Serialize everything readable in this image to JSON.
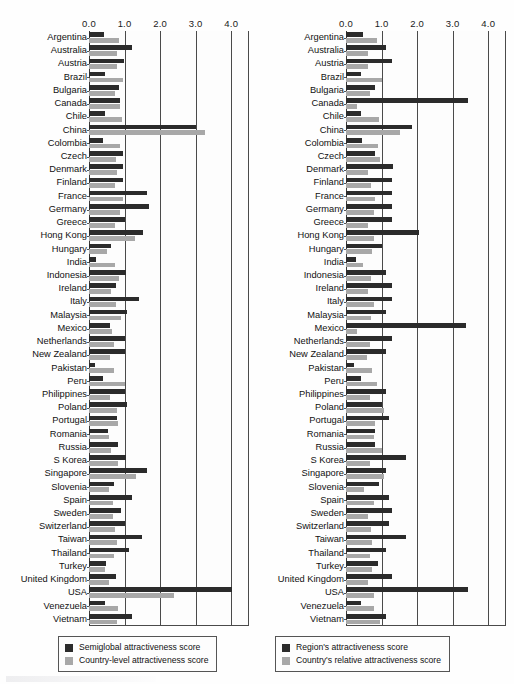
{
  "figure": {
    "type_note": "Two paired horizontal bar charts of country attractiveness scores",
    "axis_ticks": [
      "0.0",
      "1.0",
      "2.0",
      "3.0",
      "4.0"
    ],
    "axis_tick_values": [
      0.0,
      1.0,
      2.0,
      3.0,
      4.0
    ],
    "xlim": [
      0.0,
      4.5
    ],
    "grid": true
  },
  "countries": [
    "Argentina",
    "Australia",
    "Austria",
    "Brazil",
    "Bulgaria",
    "Canada",
    "Chile",
    "China",
    "Colombia",
    "Czech",
    "Denmark",
    "Finland",
    "France",
    "Germany",
    "Greece",
    "Hong Kong",
    "Hungary",
    "India",
    "Indonesia",
    "Ireland",
    "Italy",
    "Malaysia",
    "Mexico",
    "Netherlands",
    "New Zealand",
    "Pakistan",
    "Peru",
    "Philippines",
    "Poland",
    "Portugal",
    "Romania",
    "Russia",
    "S Korea",
    "Singapore",
    "Slovenia",
    "Spain",
    "Sweden",
    "Switzerland",
    "Taiwan",
    "Thailand",
    "Turkey",
    "United Kingdom",
    "USA",
    "Venezuela",
    "Vietnam"
  ],
  "left_panel": {
    "legend": [
      {
        "label": "Semiglobal attractiveness score",
        "color": "#2b2b2b",
        "key": "semiglobal"
      },
      {
        "label": "Country-level attractiveness score",
        "color": "#a8a8a8",
        "key": "country_level"
      }
    ]
  },
  "right_panel": {
    "legend": [
      {
        "label": "Region's attractiveness score",
        "color": "#2b2b2b",
        "key": "region"
      },
      {
        "label": "Country's relative attractiveness score",
        "color": "#a8a8a8",
        "key": "country_relative"
      }
    ]
  },
  "chart_data": [
    {
      "type": "bar",
      "orientation": "horizontal",
      "panel": "left",
      "title": "",
      "xlabel": "",
      "ylabel": "",
      "xlim": [
        0.0,
        4.5
      ],
      "tick_labels": [
        "0.0",
        "1.0",
        "2.0",
        "3.0",
        "4.0"
      ],
      "grid": true,
      "legend_position": "below",
      "categories": [
        "Argentina",
        "Australia",
        "Austria",
        "Brazil",
        "Bulgaria",
        "Canada",
        "Chile",
        "China",
        "Colombia",
        "Czech",
        "Denmark",
        "Finland",
        "France",
        "Germany",
        "Greece",
        "Hong Kong",
        "Hungary",
        "India",
        "Indonesia",
        "Ireland",
        "Italy",
        "Malaysia",
        "Mexico",
        "Netherlands",
        "New Zealand",
        "Pakistan",
        "Peru",
        "Philippines",
        "Poland",
        "Portugal",
        "Romania",
        "Russia",
        "S Korea",
        "Singapore",
        "Slovenia",
        "Spain",
        "Sweden",
        "Switzerland",
        "Taiwan",
        "Thailand",
        "Turkey",
        "United Kingdom",
        "USA",
        "Venezuela",
        "Vietnam"
      ],
      "series": [
        {
          "name": "Semiglobal attractiveness score",
          "color": "#2b2b2b",
          "values": [
            0.42,
            1.22,
            0.98,
            0.46,
            0.85,
            0.88,
            0.44,
            3.0,
            0.4,
            0.95,
            0.97,
            0.96,
            1.62,
            1.68,
            1.02,
            1.52,
            0.62,
            0.2,
            1.05,
            0.75,
            1.4,
            1.08,
            0.58,
            1.0,
            1.02,
            0.16,
            0.38,
            1.02,
            1.08,
            0.78,
            0.54,
            0.82,
            1.05,
            1.62,
            0.7,
            1.2,
            0.9,
            1.02,
            1.5,
            1.12,
            0.48,
            0.75,
            4.02,
            0.45,
            1.22
          ]
        },
        {
          "name": "Country-level attractiveness score",
          "color": "#a8a8a8",
          "values": [
            0.85,
            0.8,
            0.78,
            0.95,
            0.72,
            0.86,
            0.92,
            3.25,
            0.88,
            0.75,
            0.8,
            0.72,
            0.95,
            0.88,
            0.72,
            1.3,
            0.5,
            0.72,
            0.85,
            0.62,
            0.75,
            0.9,
            0.65,
            0.7,
            0.58,
            0.7,
            1.0,
            0.6,
            0.78,
            0.82,
            0.55,
            0.62,
            0.82,
            1.32,
            0.55,
            0.68,
            0.68,
            0.72,
            0.78,
            0.7,
            0.45,
            0.55,
            2.38,
            0.82,
            0.8
          ]
        }
      ]
    },
    {
      "type": "bar",
      "orientation": "horizontal",
      "panel": "right",
      "title": "",
      "xlabel": "",
      "ylabel": "",
      "xlim": [
        0.0,
        4.5
      ],
      "tick_labels": [
        "0.0",
        "1.0",
        "2.0",
        "3.0",
        "4.0"
      ],
      "grid": true,
      "legend_position": "below",
      "categories": [
        "Argentina",
        "Australia",
        "Austria",
        "Brazil",
        "Bulgaria",
        "Canada",
        "Chile",
        "China",
        "Colombia",
        "Czech",
        "Denmark",
        "Finland",
        "France",
        "Germany",
        "Greece",
        "Hong Kong",
        "Hungary",
        "India",
        "Indonesia",
        "Ireland",
        "Italy",
        "Malaysia",
        "Mexico",
        "Netherlands",
        "New Zealand",
        "Pakistan",
        "Peru",
        "Philippines",
        "Poland",
        "Portugal",
        "Romania",
        "Russia",
        "S Korea",
        "Singapore",
        "Slovenia",
        "Spain",
        "Sweden",
        "Switzerland",
        "Taiwan",
        "Thailand",
        "Turkey",
        "United Kingdom",
        "USA",
        "Venezuela",
        "Vietnam"
      ],
      "series": [
        {
          "name": "Region's attractiveness score",
          "color": "#2b2b2b",
          "values": [
            0.48,
            1.12,
            1.3,
            0.42,
            0.82,
            3.42,
            0.42,
            1.85,
            0.46,
            0.82,
            1.32,
            1.28,
            1.3,
            1.3,
            1.3,
            2.05,
            1.02,
            0.28,
            1.12,
            1.28,
            1.3,
            1.12,
            3.38,
            1.28,
            1.12,
            0.22,
            0.42,
            1.12,
            1.02,
            1.22,
            0.82,
            0.82,
            1.68,
            1.12,
            0.92,
            1.22,
            1.28,
            1.22,
            1.68,
            1.12,
            0.9,
            1.3,
            3.42,
            0.42,
            1.12
          ]
        },
        {
          "name": "Country's relative attractiveness score",
          "color": "#a8a8a8",
          "values": [
            0.88,
            0.62,
            0.62,
            1.0,
            0.68,
            0.32,
            0.92,
            1.52,
            0.9,
            0.95,
            0.62,
            0.7,
            0.82,
            0.78,
            0.62,
            0.78,
            0.72,
            0.48,
            0.7,
            0.62,
            0.78,
            0.7,
            0.3,
            0.68,
            0.58,
            0.72,
            0.88,
            0.68,
            1.08,
            0.82,
            0.8,
            1.02,
            0.68,
            1.08,
            0.52,
            0.78,
            0.62,
            0.7,
            0.72,
            0.68,
            0.72,
            0.62,
            0.78,
            0.8,
            0.95
          ]
        }
      ]
    }
  ]
}
